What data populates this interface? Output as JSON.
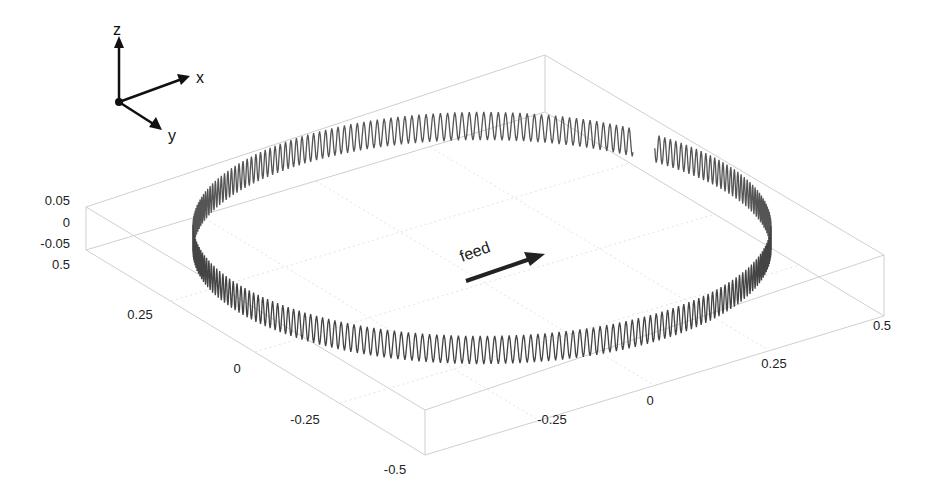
{
  "chart_data": {
    "type": "line",
    "title": "",
    "xlabel": "",
    "ylabel": "",
    "zlabel": "",
    "xlim": [
      -0.5,
      0.5
    ],
    "ylim": [
      -0.5,
      0.5
    ],
    "zlim": [
      -0.05,
      0.05
    ],
    "x_ticks": [
      "-0.5",
      "-0.25",
      "0",
      "0.25",
      "0.5"
    ],
    "y_ticks": [
      "-0.5",
      "-0.25",
      "0",
      "0.25",
      "0.5"
    ],
    "z_ticks": [
      "-0.05",
      "0",
      "0.05"
    ],
    "series": [
      {
        "name": "path",
        "radius": 0.5,
        "amplitude": 0.05,
        "oscillations": 250,
        "gap": true
      }
    ],
    "grid": true,
    "legend": null
  },
  "orientation": {
    "x": "x",
    "y": "y",
    "z": "z"
  },
  "annotation": {
    "text": "feed"
  },
  "ticks": {
    "z": [
      "0.05",
      "0",
      "-0.05"
    ],
    "y_left": [
      "0.5",
      "0.25",
      "0",
      "-0.25",
      "-0.5"
    ],
    "x_bottom": [
      "-0.25",
      "0",
      "0.25",
      "0.5"
    ]
  },
  "colors": {
    "curve": "#4a4a4a",
    "box": "#cfcfcf",
    "text": "#222222"
  }
}
